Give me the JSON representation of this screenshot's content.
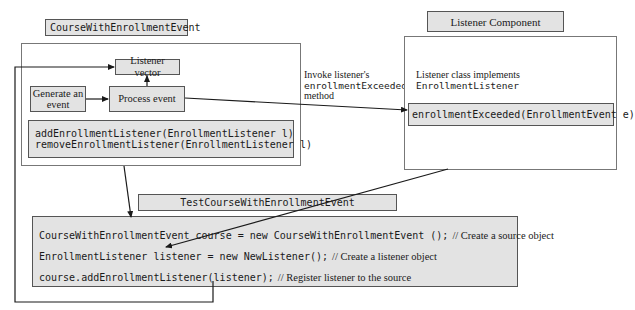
{
  "source_component": {
    "title": "CourseWithEnrollmentEvent",
    "nodes": {
      "listener_vector": "Listener vector",
      "generate_event_line1": "Generate an",
      "generate_event_line2": "event",
      "process_event": "Process event"
    },
    "methods": [
      "addEnrollmentListener(EnrollmentListener l)",
      "removeEnrollmentListener(EnrollmentListener l)"
    ]
  },
  "invoke_label": {
    "line1": "Invoke listener's",
    "line2": "enrollmentExceeded",
    "line3": "method"
  },
  "listener_component": {
    "title": "Listener Component",
    "description_line1": "Listener class implements",
    "description_line2": "EnrollmentListener",
    "method": "enrollmentExceeded(EnrollmentEvent e)"
  },
  "test_component": {
    "title": "TestCourseWithEnrollmentEvent",
    "lines": [
      {
        "code": "CourseWithEnrollmentEvent course = new CourseWithEnrollmentEvent ();",
        "comment": "// Create a source object"
      },
      {
        "code": "EnrollmentListener listener = new NewListener();",
        "comment": "// Create a listener object"
      },
      {
        "code": "course.addEnrollmentListener(listener);",
        "comment": "// Register listener to the source"
      }
    ]
  },
  "colors": {
    "box_fill": "#e3e3e3",
    "border": "#555555",
    "line": "#1a1a1a"
  }
}
